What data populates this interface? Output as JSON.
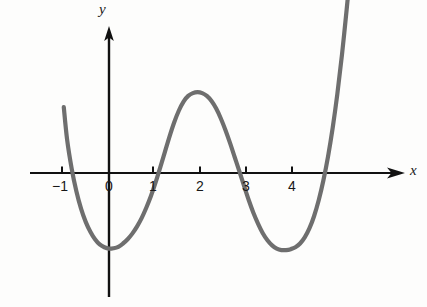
{
  "figure": {
    "kind": "cartesian-graph",
    "background_color": "#fdfdfc",
    "width": 427,
    "height": 307
  },
  "axes": {
    "x_axis_label": "x",
    "y_axis_label": "y",
    "axis_color": "#111111",
    "origin_px": {
      "x": 109,
      "y": 173
    },
    "pixels_per_unit_x": 46.6,
    "pixels_per_unit_y": 47.0,
    "x_axis_start_px": 30,
    "x_axis_end_px": 404,
    "y_axis_top_px": 28,
    "y_axis_bottom_px": 297
  },
  "ticks": {
    "x": [
      {
        "label": "-1",
        "value": -1,
        "px": 62
      },
      {
        "label": "0",
        "value": 0,
        "px": 109
      },
      {
        "label": "1",
        "value": 1,
        "px": 153
      },
      {
        "label": "2",
        "value": 2,
        "px": 200
      },
      {
        "label": "3",
        "value": 3,
        "px": 246
      },
      {
        "label": "4",
        "value": 4,
        "px": 292
      }
    ],
    "y": []
  },
  "chart_data": {
    "type": "line",
    "title": "",
    "xlabel": "x",
    "ylabel": "y",
    "xlim": [
      -1.15,
      5.6
    ],
    "ylim": [
      -2.0,
      2.2
    ],
    "grid": false,
    "legend": null,
    "curve_color": "#6e6e6e",
    "curve_width": 4.2,
    "series": [
      {
        "name": "quartic-polynomial",
        "description": "Quartic curve with four x-intercepts, two local minima and one local maximum",
        "x": [
          -0.97,
          -0.9,
          -0.8,
          -0.7,
          -0.6,
          -0.5,
          -0.4,
          -0.3,
          -0.2,
          -0.1,
          0.0,
          0.1,
          0.2,
          0.3,
          0.4,
          0.5,
          0.6,
          0.7,
          0.8,
          0.9,
          1.0,
          1.1,
          1.2,
          1.3,
          1.4,
          1.5,
          1.6,
          1.7,
          1.8,
          1.9,
          2.0,
          2.1,
          2.2,
          2.3,
          2.4,
          2.5,
          2.6,
          2.7,
          2.8,
          2.9,
          3.0,
          3.1,
          3.2,
          3.3,
          3.4,
          3.5,
          3.6,
          3.7,
          3.8,
          3.9,
          4.0,
          4.1,
          4.2,
          4.3,
          4.4,
          4.5,
          4.6,
          4.7,
          4.8,
          4.9,
          5.0,
          5.1,
          5.17,
          5.25
        ],
        "y": [
          1.4,
          0.72,
          0.09,
          -0.39,
          -0.76,
          -1.04,
          -1.25,
          -1.41,
          -1.52,
          -1.58,
          -1.61,
          -1.6,
          -1.57,
          -1.5,
          -1.41,
          -1.29,
          -1.14,
          -0.96,
          -0.74,
          -0.49,
          -0.2,
          0.12,
          0.45,
          0.78,
          1.08,
          1.33,
          1.52,
          1.64,
          1.7,
          1.72,
          1.7,
          1.64,
          1.53,
          1.37,
          1.16,
          0.91,
          0.63,
          0.33,
          0.03,
          -0.28,
          -0.58,
          -0.85,
          -1.08,
          -1.28,
          -1.43,
          -1.54,
          -1.61,
          -1.64,
          -1.64,
          -1.62,
          -1.58,
          -1.5,
          -1.37,
          -1.18,
          -0.92,
          -0.58,
          -0.16,
          0.35,
          0.96,
          1.68,
          2.52,
          3.48,
          4.2,
          5.05
        ],
        "zeros": [
          -0.82,
          0.94,
          2.81,
          5.09
        ],
        "local_minima": [
          {
            "x": 0.0,
            "y": -1.61
          },
          {
            "x": 3.75,
            "y": -1.65
          }
        ],
        "local_maxima": [
          {
            "x": 1.9,
            "y": 1.72
          }
        ]
      }
    ]
  }
}
